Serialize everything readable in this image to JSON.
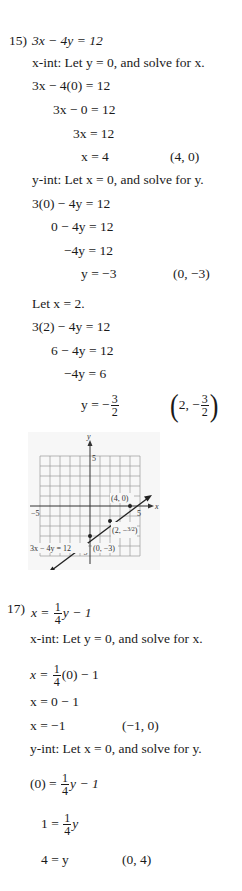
{
  "problem15": {
    "number": "15)",
    "equation": "3x − 4y = 12",
    "xint_label": "x-int: Let y = 0, and solve for x.",
    "xint_steps": [
      "3x − 4(0) = 12",
      "3x − 0 = 12",
      "3x = 12",
      "x = 4"
    ],
    "xint_point": "(4, 0)",
    "yint_label": "y-int: Let x = 0, and solve for y.",
    "yint_steps": [
      "3(0) − 4y = 12",
      "0 − 4y = 12",
      "−4y = 12",
      "y = −3"
    ],
    "yint_point": "(0, −3)",
    "extra_label": "Let x = 2.",
    "extra_steps": [
      "3(2) − 4y = 12",
      "6 − 4y = 12",
      "−4y = 6"
    ],
    "extra_result_lhs": "y = −",
    "extra_result_num": "3",
    "extra_result_den": "2",
    "extra_point_x": "2, −",
    "extra_point_num": "3",
    "extra_point_den": "2",
    "graph": {
      "y_axis_label": "y",
      "x_axis_label": "x",
      "tick_y_top": "5",
      "tick_y_bottom": "−5",
      "tick_x_left": "−5",
      "tick_x_right": "5",
      "point_a": "(4, 0)",
      "point_b": "(2, −3/2)",
      "point_c": "(0, −3)",
      "line_label": "3x − 4y = 12"
    }
  },
  "problem17": {
    "number": "17)",
    "eq_lhs": "x = ",
    "eq_num": "1",
    "eq_den": "4",
    "eq_rhs": "y − 1",
    "xint_label": "x-int: Let y = 0, and solve for x.",
    "step1_lhs": "x = ",
    "step1_num": "1",
    "step1_den": "4",
    "step1_rhs": "(0) − 1",
    "step2": "x = 0 − 1",
    "step3": "x = −1",
    "xint_point": "(−1, 0)",
    "yint_label": "y-int: Let x = 0, and solve for y.",
    "ystep1_lhs": "(0) = ",
    "ystep1_num": "1",
    "ystep1_den": "4",
    "ystep1_rhs": "y − 1",
    "ystep2_lhs": "1 = ",
    "ystep2_num": "1",
    "ystep2_den": "4",
    "ystep2_rhs": "y",
    "ystep3": "4 = y",
    "yint_point": "(0, 4)"
  }
}
